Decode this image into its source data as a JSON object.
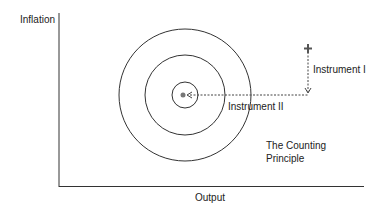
{
  "diagram": {
    "y_axis_label": "Inflation",
    "x_axis_label": "Output",
    "labels": {
      "instrument_1": "Instrument I",
      "instrument_2": "Instrument II",
      "principle_line1": "The Counting",
      "principle_line2": "Principle"
    },
    "target_circles": 3,
    "colors": {
      "line": "#333333",
      "background": "#ffffff"
    }
  }
}
